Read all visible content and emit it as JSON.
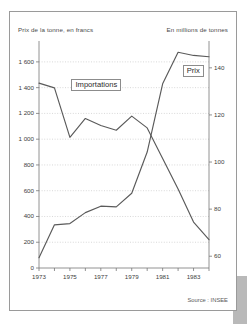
{
  "figure": {
    "left_axis_caption": "Prix de la tonne, en francs",
    "right_axis_caption": "En millions de tonnes",
    "source_note": "Source : INSEE"
  },
  "chart_data": {
    "type": "line",
    "title": "",
    "subtitle": "",
    "xlabel": "",
    "ylabel": "Prix de la tonne, en francs",
    "y2label": "En millions de tonnes",
    "grid": true,
    "grid_orientation": "horizontal",
    "legend": "inline-labels",
    "x": [
      1973,
      1974,
      1975,
      1976,
      1977,
      1978,
      1979,
      1980,
      1981,
      1982,
      1983,
      1984
    ],
    "xlim": [
      1973,
      1984
    ],
    "xticks": [
      1973,
      1974,
      1975,
      1976,
      1977,
      1978,
      1979,
      1980,
      1981,
      1982,
      1983,
      1984
    ],
    "xticklabels": [
      "1973",
      "",
      "1975",
      "",
      "1977",
      "",
      "1979",
      "",
      "1981",
      "",
      "1983",
      ""
    ],
    "ylim": [
      0,
      1700
    ],
    "yticks": [
      0,
      200,
      400,
      600,
      800,
      1000,
      1200,
      1400,
      1600
    ],
    "yticklabels": [
      "0",
      "200",
      "400",
      "600",
      "800",
      "1 000",
      "1 200",
      "1 400",
      "1 600"
    ],
    "y2lim": [
      55,
      148
    ],
    "y2ticks": [
      60,
      80,
      100,
      120,
      140
    ],
    "y2ticklabels": [
      "60",
      "80",
      "100",
      "120",
      "140"
    ],
    "series": [
      {
        "name": "Prix",
        "label": "Prix",
        "axis": "left",
        "unit": "francs par tonne",
        "color": "#5a5a5a",
        "values": [
          80,
          335,
          345,
          430,
          480,
          475,
          580,
          900,
          1430,
          1675,
          1650,
          1640
        ]
      },
      {
        "name": "Importations",
        "label": "Importations",
        "axis": "right",
        "unit": "millions de tonnes",
        "color": "#5a5a5a",
        "values": [
          133.5,
          131.5,
          110.5,
          118.5,
          115.5,
          113.5,
          119.5,
          114.5,
          101.5,
          88.5,
          74.5,
          67.0
        ]
      }
    ],
    "annotations": [
      {
        "text": "Importations",
        "x": 1975.1,
        "y2": 133.0,
        "boxed": true
      },
      {
        "text": "Prix",
        "x": 1982.3,
        "y": 1540,
        "boxed": true
      }
    ]
  }
}
